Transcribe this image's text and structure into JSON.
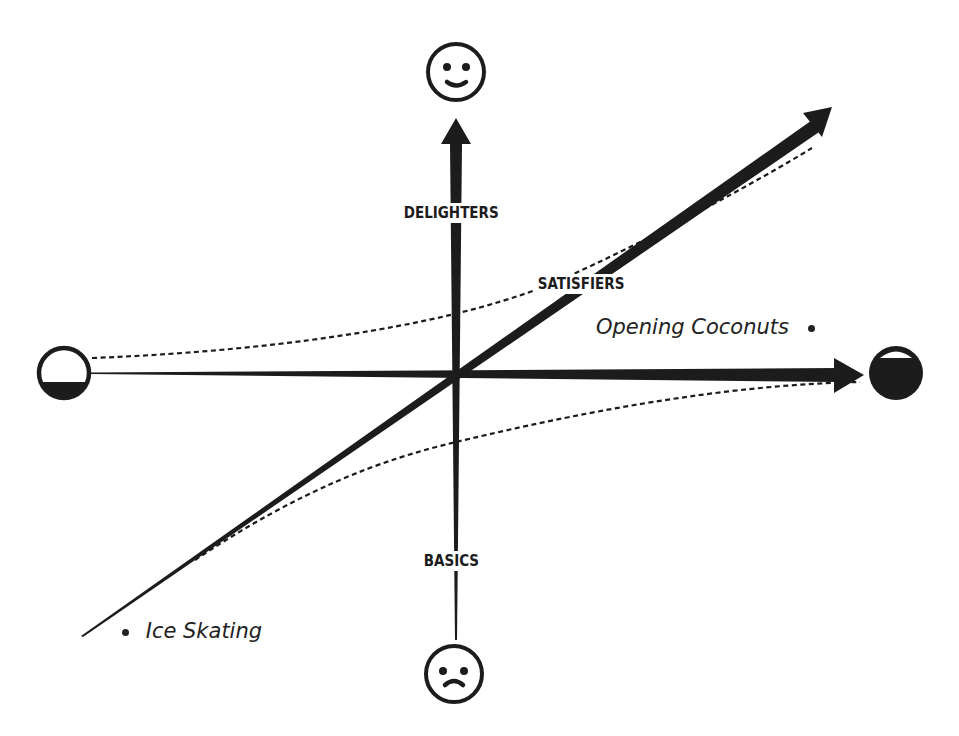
{
  "diagram": {
    "type": "kano-model",
    "colors": {
      "ink": "#1c1c1c",
      "background": "#ffffff"
    },
    "axes": {
      "vertical": {
        "top_icon": "smiley-face-icon",
        "bottom_icon": "frowning-face-icon"
      },
      "horizontal": {
        "left_icon": "empty-circle-icon",
        "right_icon": "filled-circle-icon"
      }
    },
    "categories": {
      "delighters": "DELIGHTERS",
      "satisfiers": "SATISFIERS",
      "basics": "BASICS"
    },
    "examples": [
      {
        "label": "Opening Coconuts",
        "position": "right"
      },
      {
        "label": "Ice Skating",
        "position": "left"
      }
    ]
  }
}
